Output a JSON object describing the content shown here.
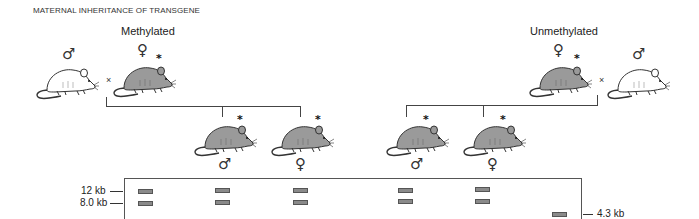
{
  "title": "MATERNAL INHERITANCE OF TRANSGENE",
  "groups": {
    "left": {
      "label": "Methylated",
      "parents": [
        {
          "sex": "male",
          "symbol": "♂",
          "color": "white",
          "transgene": false
        },
        {
          "sex": "female",
          "symbol": "♀",
          "color": "gray",
          "transgene": true,
          "marker": "*"
        }
      ],
      "cross_symbol": "×",
      "offspring": [
        {
          "sex": "male",
          "symbol": "♂",
          "color": "gray",
          "marker": "*"
        },
        {
          "sex": "female",
          "symbol": "♀",
          "color": "gray",
          "marker": "*"
        }
      ]
    },
    "right": {
      "label": "Unmethylated",
      "parents": [
        {
          "sex": "female",
          "symbol": "♀",
          "color": "gray",
          "transgene": true,
          "marker": "*"
        },
        {
          "sex": "male",
          "symbol": "♂",
          "color": "white",
          "transgene": false
        }
      ],
      "cross_symbol": "×",
      "offspring": [
        {
          "sex": "male",
          "symbol": "♂",
          "color": "gray",
          "marker": "*"
        },
        {
          "sex": "female",
          "symbol": "♀",
          "color": "gray",
          "marker": "*"
        }
      ]
    }
  },
  "gel": {
    "size_markers": [
      {
        "label": "12 kb",
        "side": "left"
      },
      {
        "label": "8.0 kb",
        "side": "left"
      },
      {
        "label": "4.3 kb",
        "side": "right"
      }
    ],
    "lanes": [
      {
        "bands": [
          "12 kb",
          "8.0 kb"
        ]
      },
      {
        "bands": [
          "12 kb",
          "8.0 kb"
        ]
      },
      {
        "bands": [
          "12 kb",
          "8.0 kb"
        ]
      },
      {
        "bands": [
          "12 kb",
          "8.0 kb"
        ]
      },
      {
        "bands": [
          "12 kb",
          "8.0 kb"
        ]
      },
      {
        "bands": [
          "4.3 kb"
        ]
      }
    ]
  },
  "colors": {
    "transgenic_mouse": "#9a9a9a",
    "wildtype_mouse": "#ffffff",
    "band_fill": "#8a8a8a",
    "line": "#444444"
  }
}
